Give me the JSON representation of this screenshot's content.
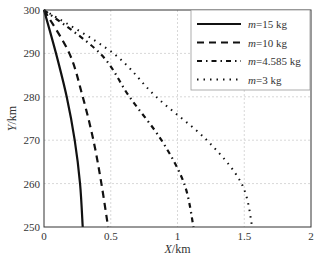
{
  "chart_data": {
    "type": "line",
    "title": "",
    "xlabel": "X/km",
    "ylabel": "Y/km",
    "xlim": [
      0,
      2
    ],
    "ylim": [
      250,
      300
    ],
    "x_ticks": [
      "0",
      "0.5",
      "1",
      "1.5",
      "2"
    ],
    "x_tick_values": [
      0,
      0.5,
      1,
      1.5,
      2
    ],
    "y_ticks": [
      "250",
      "260",
      "270",
      "280",
      "290",
      "300"
    ],
    "y_tick_values": [
      250,
      260,
      270,
      280,
      290,
      300
    ],
    "grid": true,
    "legend_position": "top-right",
    "series": [
      {
        "name": "m=15 kg",
        "label_italic": "m",
        "label_rest": "=15 kg",
        "style": "solid",
        "x": [
          0,
          0.09,
          0.17,
          0.23,
          0.27,
          0.29
        ],
        "y": [
          300,
          290,
          280,
          270,
          260,
          250
        ]
      },
      {
        "name": "m=10 kg",
        "label_italic": "m",
        "label_rest": "=10 kg",
        "style": "dashed",
        "x": [
          0,
          0.19,
          0.29,
          0.37,
          0.43,
          0.48
        ],
        "y": [
          300,
          290,
          280,
          270,
          260,
          250
        ]
      },
      {
        "name": "m=4.585 kg",
        "label_italic": "m",
        "label_rest": "=4.585 kg",
        "style": "dashdot",
        "x": [
          0,
          0.42,
          0.64,
          0.88,
          1.05,
          1.12
        ],
        "y": [
          300,
          290,
          280,
          270,
          260,
          250
        ]
      },
      {
        "name": "m=3 kg",
        "label_italic": "m",
        "label_rest": "=3 kg",
        "style": "dotted",
        "x": [
          0,
          0.52,
          0.84,
          1.22,
          1.48,
          1.56
        ],
        "y": [
          300,
          290,
          280,
          270,
          260,
          250
        ]
      }
    ]
  }
}
